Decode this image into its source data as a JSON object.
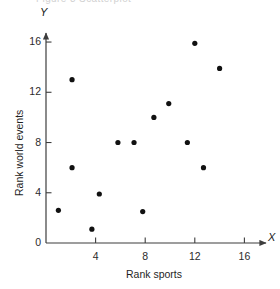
{
  "figure": {
    "clipped_top_caption": "Figure 3   Scatterplot",
    "background_color": "#ffffff",
    "marker_color": "#111111",
    "axis_color": "#3d3d3d"
  },
  "axes": {
    "x_axis_letter": "X",
    "y_axis_letter": "Y",
    "x_title": "Rank sports",
    "y_title": "Rank world events",
    "x_ticks": [
      "0",
      "4",
      "8",
      "12",
      "16"
    ],
    "y_ticks": [
      "0",
      "4",
      "8",
      "12",
      "16"
    ]
  },
  "chart_data": {
    "type": "scatter",
    "title": "",
    "xlabel": "Rank sports",
    "ylabel": "Rank world events",
    "xlim": [
      0,
      17.5
    ],
    "ylim": [
      0,
      17.5
    ],
    "grid": false,
    "legend": null,
    "x_ticks": [
      0,
      4,
      8,
      12,
      16
    ],
    "y_ticks": [
      0,
      4,
      8,
      12,
      16
    ],
    "marker": "filled-circle",
    "marker_radius_px": 2.6,
    "n_points": 14,
    "points": [
      {
        "x": 1.0,
        "y": 2.6
      },
      {
        "x": 2.1,
        "y": 13.0
      },
      {
        "x": 2.1,
        "y": 6.0
      },
      {
        "x": 3.7,
        "y": 1.1
      },
      {
        "x": 4.3,
        "y": 3.9
      },
      {
        "x": 5.8,
        "y": 8.0
      },
      {
        "x": 7.1,
        "y": 8.0
      },
      {
        "x": 7.8,
        "y": 2.5
      },
      {
        "x": 8.7,
        "y": 10.0
      },
      {
        "x": 9.9,
        "y": 11.1
      },
      {
        "x": 11.4,
        "y": 8.0
      },
      {
        "x": 12.0,
        "y": 15.9
      },
      {
        "x": 12.7,
        "y": 6.0
      },
      {
        "x": 14.0,
        "y": 13.9
      }
    ]
  }
}
